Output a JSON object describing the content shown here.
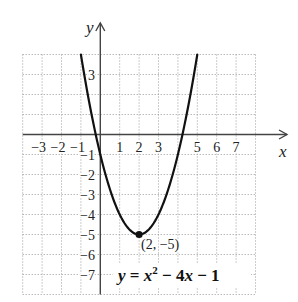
{
  "figure": {
    "axis_labels": {
      "x": "x",
      "y": "y"
    },
    "vertex_label": "(2, −5)",
    "equation": {
      "text": "y = x² − 4x − 1",
      "lhs": "y",
      "eq": " = ",
      "var1": "x",
      "exp": "2",
      "op1": " − 4",
      "var2": "x",
      "op2": " − 1"
    }
  },
  "colors": {
    "background": "#ffffff",
    "grid": "#9a9a9a",
    "axis": "#444444",
    "curve": "#111111",
    "text": "#222222"
  },
  "chart_data": {
    "type": "line",
    "title": "",
    "xlabel": "x",
    "ylabel": "y",
    "xlim": [
      -4,
      8
    ],
    "ylim": [
      -8,
      4
    ],
    "grid": true,
    "grid_style": "dotted",
    "x_ticks": [
      -3,
      -2,
      -1,
      1,
      2,
      3,
      5,
      6,
      7
    ],
    "x_tick_labels": [
      "−3",
      "−2",
      "−1",
      "1",
      "2",
      "3",
      "5",
      "6",
      "7"
    ],
    "y_ticks": [
      3,
      -1,
      -2,
      -3,
      -4,
      -5,
      -6,
      -7
    ],
    "y_tick_labels": [
      "3",
      "−1",
      "−2",
      "−3",
      "−4",
      "−5",
      "−6",
      "−7"
    ],
    "series": [
      {
        "name": "y = x² − 4x − 1",
        "function": {
          "form": "a*x^2 + b*x + c",
          "a": 1,
          "b": -4,
          "c": -1
        },
        "domain": [
          -1,
          5
        ],
        "x": [
          -1,
          0,
          1,
          2,
          3,
          4,
          5
        ],
        "y": [
          4,
          -1,
          -4,
          -5,
          -4,
          -1,
          4
        ]
      }
    ],
    "annotations": [
      {
        "type": "point",
        "x": 2,
        "y": -5,
        "label": "(2, −5)"
      },
      {
        "type": "text",
        "label": "y = x² − 4x − 1",
        "position": "lower-right"
      }
    ]
  }
}
